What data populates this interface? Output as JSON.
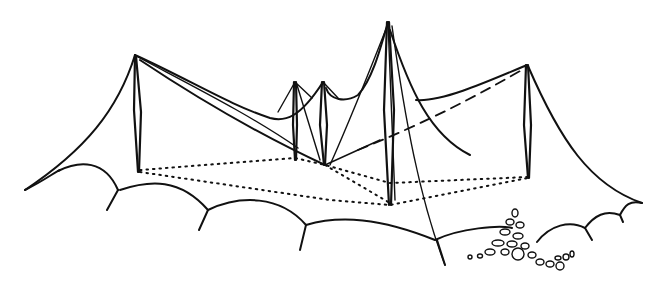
{
  "illustration": {
    "subject": "Line drawing of a tensile tent / membrane roof structure supported by masts on rolling ground",
    "style": "black ink sketch on white",
    "colors": {
      "ink": "#111111",
      "background": "#ffffff"
    },
    "masts": [
      {
        "name": "left-mast",
        "top": [
          135,
          55
        ],
        "base": [
          138,
          172
        ]
      },
      {
        "name": "small-mast-1",
        "top": [
          295,
          82
        ],
        "base": [
          295,
          160
        ]
      },
      {
        "name": "small-mast-2",
        "top": [
          323,
          82
        ],
        "base": [
          324,
          165
        ]
      },
      {
        "name": "central-tall-mast",
        "top": [
          388,
          22
        ],
        "base": [
          390,
          205
        ]
      },
      {
        "name": "right-mast",
        "top": [
          527,
          65
        ],
        "base": [
          528,
          178
        ]
      }
    ],
    "features": [
      "dotted ground footprint",
      "scalloped ground edge",
      "rock pile at lower right"
    ]
  }
}
